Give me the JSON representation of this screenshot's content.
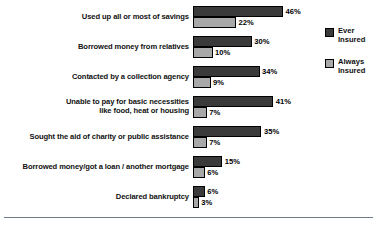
{
  "chart_data": {
    "type": "bar",
    "orientation": "horizontal",
    "title": "",
    "subtitle": "",
    "xlabel": "",
    "ylabel": "",
    "grid": false,
    "xlim": [
      0,
      46
    ],
    "legend_position": "right",
    "value_suffix": "%",
    "categories": [
      "Used up all or most of savings",
      "Borrowed money from relatives",
      "Contacted by a collection agency",
      "Unable to pay for basic necessities\nlike food, heat or housing",
      "Sought the aid of charity or public assistance",
      "Borrowed money/got a loan / another mortgage",
      "Declared bankruptcy"
    ],
    "series": [
      {
        "name": "Ever\nInsured",
        "color": "#3a3a3a",
        "values": [
          46,
          30,
          34,
          41,
          35,
          15,
          6
        ],
        "labels": [
          "46%",
          "30%",
          "34%",
          "41%",
          "35%",
          "15%",
          "6%"
        ]
      },
      {
        "name": "Always\nInsured",
        "color": "#a8a8a8",
        "values": [
          22,
          10,
          9,
          7,
          7,
          6,
          3
        ],
        "labels": [
          "22%",
          "10%",
          "9%",
          "7%",
          "7%",
          "6%",
          "3%"
        ]
      }
    ]
  }
}
